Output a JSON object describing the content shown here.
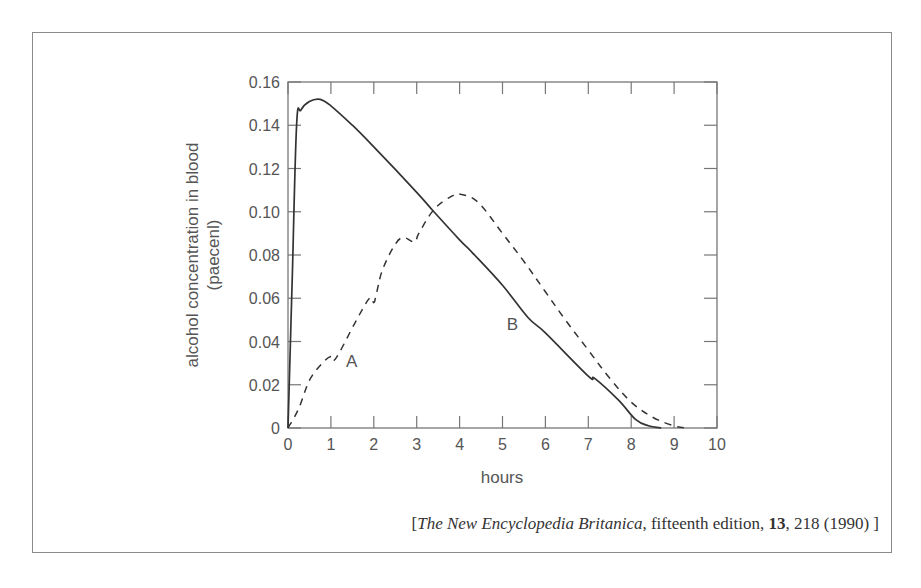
{
  "chart_data": {
    "type": "line",
    "title": "",
    "xlabel": "hours",
    "ylabel": "alcohol concentration in blood (paecenl)",
    "ylabel_lines": [
      "alcohol concentration in blood",
      "(paecenl)"
    ],
    "xlim": [
      0,
      10
    ],
    "ylim": [
      0,
      0.16
    ],
    "x_ticks": [
      "0",
      "1",
      "2",
      "3",
      "4",
      "5",
      "6",
      "7",
      "8",
      "9",
      "10"
    ],
    "y_ticks": [
      "0",
      "0.02",
      "0.04",
      "0.06",
      "0.08",
      "0.10",
      "0.12",
      "0.14",
      "0.16"
    ],
    "grid": false,
    "legend": "none (curves labeled inline)",
    "series": [
      {
        "name": "A",
        "style": "dashed",
        "x": [
          0,
          0.25,
          0.5,
          0.8,
          1.0,
          1.05,
          1.2,
          1.6,
          1.9,
          2.0,
          2.05,
          2.2,
          2.5,
          2.7,
          2.95,
          3.05,
          3.4,
          3.8,
          4.05,
          4.45,
          5.0,
          5.5,
          6.0,
          6.5,
          7.0,
          7.5,
          8.0,
          8.5,
          9.0,
          9.3
        ],
        "y": [
          0,
          0.009,
          0.022,
          0.03,
          0.033,
          0.031,
          0.035,
          0.05,
          0.06,
          0.058,
          0.061,
          0.073,
          0.085,
          0.088,
          0.086,
          0.09,
          0.101,
          0.107,
          0.108,
          0.104,
          0.09,
          0.077,
          0.063,
          0.049,
          0.036,
          0.023,
          0.012,
          0.005,
          0.001,
          0
        ]
      },
      {
        "name": "B",
        "style": "solid",
        "x": [
          0,
          0.1,
          0.2,
          0.3,
          0.5,
          0.75,
          1.0,
          1.5,
          2.0,
          3.0,
          3.4,
          4.0,
          4.3,
          5.0,
          5.6,
          6.0,
          7.0,
          7.15,
          7.7,
          8.1,
          8.4,
          8.7
        ],
        "y": [
          0,
          0.07,
          0.14,
          0.147,
          0.151,
          0.152,
          0.149,
          0.14,
          0.13,
          0.109,
          0.1,
          0.087,
          0.081,
          0.066,
          0.051,
          0.044,
          0.024,
          0.023,
          0.013,
          0.004,
          0.001,
          0
        ]
      }
    ],
    "annotations": [
      {
        "text": "A",
        "x": 1.35,
        "y": 0.031
      },
      {
        "text": "B",
        "x": 5.1,
        "y": 0.048
      }
    ]
  },
  "caption": {
    "open_bracket": "[",
    "title_italic": "The New Encyclopedia Britanica",
    "edition": ", fifteenth edition, ",
    "volume_bold": "13",
    "page_year": ", 218 (1990)",
    "close_bracket": "]"
  }
}
